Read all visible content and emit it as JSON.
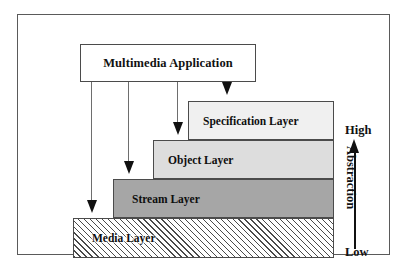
{
  "diagram": {
    "application_box": {
      "label": "Multimedia Application"
    },
    "layers": [
      {
        "id": "specification",
        "label": "Specification Layer",
        "fill": "#f0f0f0",
        "level": 4
      },
      {
        "id": "object",
        "label": "Object Layer",
        "fill": "#dddddd",
        "level": 3
      },
      {
        "id": "stream",
        "label": "Stream Layer",
        "fill": "#a6a6a6",
        "level": 2
      },
      {
        "id": "media",
        "label": "Media Layer",
        "fill": "hatched",
        "level": 1
      }
    ],
    "connectors": [
      {
        "from": "application_box",
        "to": "media",
        "arrow": "down"
      },
      {
        "from": "application_box",
        "to": "stream",
        "arrow": "down"
      },
      {
        "from": "application_box",
        "to": "object",
        "arrow": "down"
      },
      {
        "from": "application_box",
        "to": "specification",
        "arrow": "down"
      }
    ],
    "scale": {
      "axis_label": "Abstraction",
      "top_label": "High",
      "bottom_label": "Low",
      "direction": "up"
    }
  }
}
